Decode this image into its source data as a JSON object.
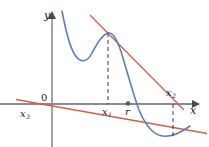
{
  "figure": {
    "colors": {
      "curve": "#5b7fc7",
      "tangent": "#d4604a",
      "axis": "#8c8c8c",
      "dashed": "#3a3a3a",
      "label": "#1a1a1a",
      "point": "#2f5fb5",
      "background": "#ffffff"
    },
    "axes": {
      "x_label": "x",
      "y_label": "y",
      "origin_label": "0",
      "x_axis_y_px": 104,
      "y_axis_x_px": 52,
      "x_axis_arrow_x_px": 196,
      "y_axis_arrow_y_px": 13
    },
    "points": [
      {
        "name": "x1",
        "base": "x",
        "sub": "1",
        "x_px": 108,
        "on_axis": true
      },
      {
        "name": "r",
        "base": "r",
        "sub": "",
        "x_px": 128,
        "on_axis": true,
        "marker": true
      },
      {
        "name": "x2",
        "base": "x",
        "sub": "2",
        "x_px": 173,
        "on_axis": true
      },
      {
        "name": "x3",
        "base": "x",
        "sub": "3",
        "x_px": 27,
        "on_axis": true
      }
    ],
    "labels": {
      "x1": "x",
      "x1_sub": "1",
      "x2": "x",
      "x2_sub": "2",
      "x3": "x",
      "x3_sub": "3",
      "r": "r"
    },
    "curve": {
      "description": "blue quartic-like curve: falls from upper left, local minimum, local maximum at x1, crosses x-axis at r, local minimum below axis near x2, rises at right edge",
      "path": "M 62,12 C 66,30 70,48 76,57 C 81,65 88,64 93,54 C 98,45 102,36 108,33 C 114,31 119,42 124,60 C 129,78 134,96 140,112 C 146,126 152,134 160,136 C 168,138 178,134 188,127"
    },
    "tangents": [
      {
        "name": "tangent-at-x1",
        "description": "tangent to curve at the local maximum above x1, meets x-axis at x2",
        "x_from_px": 93,
        "y_from_px": 18,
        "x_to_px": 182,
        "y_to_px": 108
      },
      {
        "name": "tangent-at-x2",
        "description": "tangent to curve at the local minimum below x2, meets x-axis at x3",
        "x_from_px": 20,
        "y_from_px": 100,
        "x_to_px": 205,
        "y_to_px": 133
      }
    ],
    "dashed_lines": [
      {
        "name": "dash-x1",
        "x_px": 108,
        "y_top_px": 33,
        "y_bottom_px": 104
      },
      {
        "name": "dash-x2",
        "x_px": 173,
        "y_top_px": 104,
        "y_bottom_px": 136
      }
    ]
  }
}
